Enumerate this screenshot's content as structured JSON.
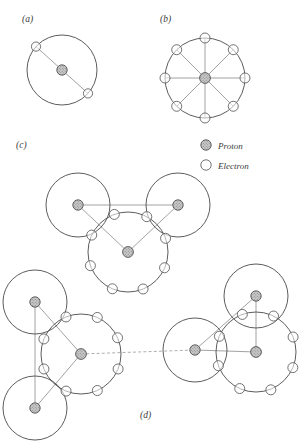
{
  "figure": {
    "background_color": "#ffffff",
    "width": 301,
    "height": 446
  },
  "legend": {
    "items": [
      {
        "label": "Proton",
        "marker": "proton-marker",
        "color": "#9a9a9a"
      },
      {
        "label": "Electron",
        "marker": "electron-marker",
        "color": "#ffffff"
      }
    ]
  },
  "panels": [
    {
      "id": "a",
      "label": "(a)",
      "label_x": 22,
      "label_y": 22,
      "description": "Atom with two electrons in a single shell",
      "atoms": [
        {
          "name": "atom-a",
          "cx": 62,
          "cy": 70,
          "r": 35,
          "proton_r": 5.2,
          "electron_count": 2,
          "electron_r": 4.6,
          "electron_angles": [
            138,
            318
          ],
          "spokes": true
        }
      ]
    },
    {
      "id": "b",
      "label": "(b)",
      "label_x": 160,
      "label_y": 22,
      "description": "Atom with eight electrons in a single shell",
      "atoms": [
        {
          "name": "atom-b",
          "cx": 205,
          "cy": 78,
          "r": 40,
          "proton_r": 5.4,
          "electron_count": 8,
          "electron_r": 5.0,
          "electron_angles": [
            0,
            45,
            90,
            135,
            180,
            225,
            270,
            315
          ],
          "spokes": true
        }
      ]
    },
    {
      "id": "c",
      "label": "(c)",
      "label_x": 16,
      "label_y": 148,
      "description": "Water molecule: two hydrogen atoms bonded to one oxygen atom",
      "atoms": [
        {
          "name": "hydrogen-left",
          "cx": 78,
          "cy": 205,
          "r": 32,
          "proton_r": 5.2,
          "electron_count": 0,
          "electron_r": 4.6,
          "electron_angles": [],
          "spokes": false
        },
        {
          "name": "hydrogen-right",
          "cx": 178,
          "cy": 205,
          "r": 32,
          "proton_r": 5.2,
          "electron_count": 0,
          "electron_r": 4.6,
          "electron_angles": [],
          "spokes": false
        },
        {
          "name": "oxygen-center",
          "cx": 128,
          "cy": 252,
          "r": 40,
          "proton_r": 5.4,
          "electron_count": 8,
          "electron_r": 5.0,
          "electron_angles": [
            20,
            62,
            110,
            155,
            200,
            247,
            292,
            336
          ],
          "spokes": false
        }
      ],
      "bonds": [
        {
          "name": "bond-h-h",
          "x1": 78,
          "y1": 205,
          "x2": 178,
          "y2": 205,
          "style": "bond"
        },
        {
          "name": "bond-hl-o",
          "x1": 78,
          "y1": 205,
          "x2": 128,
          "y2": 252,
          "style": "bond"
        },
        {
          "name": "bond-hr-o",
          "x1": 178,
          "y1": 205,
          "x2": 128,
          "y2": 252,
          "style": "bond"
        }
      ]
    },
    {
      "id": "d",
      "label": "(d)",
      "label_x": 140,
      "label_y": 418,
      "description": "Two water molecules linked by a hydrogen bond",
      "atoms": [
        {
          "name": "left-hydrogen-upper",
          "cx": 35,
          "cy": 302,
          "r": 32,
          "proton_r": 5.2,
          "electron_count": 0,
          "electron_r": 4.6,
          "electron_angles": [],
          "spokes": false
        },
        {
          "name": "left-hydrogen-lower",
          "cx": 35,
          "cy": 408,
          "r": 32,
          "proton_r": 5.2,
          "electron_count": 0,
          "electron_r": 4.6,
          "electron_angles": [],
          "spokes": false
        },
        {
          "name": "left-oxygen",
          "cx": 81,
          "cy": 354,
          "r": 40,
          "proton_r": 5.4,
          "electron_count": 8,
          "electron_r": 5.0,
          "electron_angles": [
            24,
            66,
            112,
            158,
            202,
            248,
            294,
            338
          ],
          "spokes": false
        },
        {
          "name": "right-hydrogen-left",
          "cx": 195,
          "cy": 350,
          "r": 32,
          "proton_r": 5.2,
          "electron_count": 0,
          "electron_r": 4.6,
          "electron_angles": [],
          "spokes": false
        },
        {
          "name": "right-hydrogen-upper",
          "cx": 256,
          "cy": 296,
          "r": 32,
          "proton_r": 5.2,
          "electron_count": 0,
          "electron_r": 4.6,
          "electron_angles": [],
          "spokes": false
        },
        {
          "name": "right-oxygen",
          "cx": 256,
          "cy": 352,
          "r": 40,
          "proton_r": 5.4,
          "electron_count": 8,
          "electron_r": 5.0,
          "electron_angles": [
            22,
            64,
            110,
            156,
            200,
            246,
            292,
            337
          ],
          "spokes": false
        }
      ],
      "bonds": [
        {
          "name": "bond-left-hh",
          "x1": 35,
          "y1": 302,
          "x2": 35,
          "y2": 408,
          "style": "bond"
        },
        {
          "name": "bond-left-hu-o",
          "x1": 35,
          "y1": 302,
          "x2": 81,
          "y2": 354,
          "style": "bond"
        },
        {
          "name": "bond-left-hl-o",
          "x1": 35,
          "y1": 408,
          "x2": 81,
          "y2": 354,
          "style": "bond"
        },
        {
          "name": "bond-right-hh",
          "x1": 195,
          "y1": 350,
          "x2": 256,
          "y2": 296,
          "style": "bond"
        },
        {
          "name": "bond-right-hl-o",
          "x1": 195,
          "y1": 350,
          "x2": 256,
          "y2": 352,
          "style": "bond"
        },
        {
          "name": "bond-right-hu-o",
          "x1": 256,
          "y1": 296,
          "x2": 256,
          "y2": 352,
          "style": "bond"
        }
      ],
      "hydrogen_bond": {
        "name": "hydrogen-bond-link",
        "x1": 81,
        "y1": 354,
        "x2": 195,
        "y2": 350,
        "style": "dashed"
      }
    }
  ]
}
